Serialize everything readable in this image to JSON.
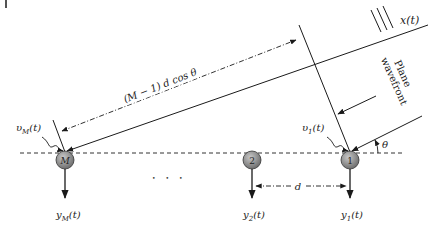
{
  "diagram": {
    "colors": {
      "line": "#1a1a1a",
      "sensor_fill": "#8a8a8a",
      "sensor_stroke": "#333333",
      "background": "#ffffff"
    },
    "source_signal": "x(t)",
    "wavefront_label_line1": "Plane",
    "wavefront_label_line2": "wavefront",
    "angle_label": "θ",
    "path_difference_label": "(M − 1) d cos θ",
    "spacing_label": "d",
    "ellipsis": "• • •",
    "sensors": [
      {
        "id": "M",
        "label": "M",
        "noise": "υ_M(t)",
        "noise_base": "υ",
        "noise_sub": "M",
        "output_base": "y",
        "output_sub": "M",
        "output_tail": "(t)"
      },
      {
        "id": "2",
        "label": "2",
        "output_base": "y",
        "output_sub": "2",
        "output_tail": "(t)"
      },
      {
        "id": "1",
        "label": "1",
        "noise": "υ_1(t)",
        "noise_base": "υ",
        "noise_sub": "1",
        "output_base": "y",
        "output_sub": "1",
        "output_tail": "(t)"
      }
    ],
    "noise_tail": "(t)"
  }
}
